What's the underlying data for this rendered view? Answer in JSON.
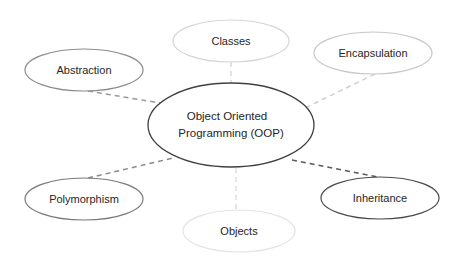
{
  "diagram": {
    "type": "mind-map",
    "center": {
      "id": "oop",
      "label_line1": "Object Oriented",
      "label_line2": "Programming (OOP)",
      "cx": 231,
      "cy": 125,
      "rx": 83,
      "ry": 42,
      "stroke": "#404040"
    },
    "nodes": [
      {
        "id": "classes",
        "label": "Classes",
        "cx": 231,
        "cy": 41,
        "rx": 58,
        "ry": 21,
        "stroke": "#d6d6d6",
        "edge": {
          "x1": 231,
          "y1": 62,
          "x2": 231,
          "y2": 83,
          "stroke": "#d9d9d9"
        }
      },
      {
        "id": "abstraction",
        "label": "Abstraction",
        "cx": 84,
        "cy": 70,
        "rx": 59,
        "ry": 21,
        "stroke": "#8c8c8c",
        "edge": {
          "x1": 88,
          "y1": 91,
          "x2": 166,
          "y2": 104,
          "stroke": "#9a9a9a"
        }
      },
      {
        "id": "encapsulation",
        "label": "Encapsulation",
        "cx": 373,
        "cy": 53,
        "rx": 59,
        "ry": 21,
        "stroke": "#c8c8c8",
        "edge": {
          "x1": 375,
          "y1": 74,
          "x2": 305,
          "y2": 108,
          "stroke": "#cfcfcf"
        }
      },
      {
        "id": "polymorphism",
        "label": "Polymorphism",
        "cx": 84,
        "cy": 199,
        "rx": 59,
        "ry": 21,
        "stroke": "#7a7a7a",
        "edge": {
          "x1": 88,
          "y1": 178,
          "x2": 173,
          "y2": 158,
          "stroke": "#8a8a8a"
        }
      },
      {
        "id": "objects",
        "label": "Objects",
        "cx": 239,
        "cy": 231,
        "rx": 56,
        "ry": 21,
        "stroke": "#e3e3e3",
        "edge": {
          "x1": 236,
          "y1": 168,
          "x2": 236,
          "y2": 210,
          "stroke": "#e0e0e0"
        }
      },
      {
        "id": "inheritance",
        "label": "Inheritance",
        "cx": 380,
        "cy": 198,
        "rx": 59,
        "ry": 21,
        "stroke": "#4a4a4a",
        "edge": {
          "x1": 292,
          "y1": 160,
          "x2": 378,
          "y2": 177,
          "stroke": "#5a5a5a"
        }
      }
    ]
  }
}
